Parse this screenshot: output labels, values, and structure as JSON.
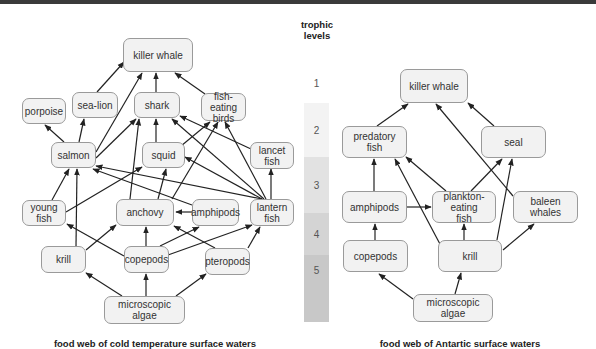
{
  "trophic": {
    "title": "trophic\nlevels",
    "levels": [
      {
        "label": "1",
        "color": "#ffffff"
      },
      {
        "label": "2",
        "color": "#f3f3f3"
      },
      {
        "label": "3",
        "color": "#e2e2e2"
      },
      {
        "label": "4",
        "color": "#d4d4d4"
      },
      {
        "label": "5",
        "color": "#c8c8c8"
      }
    ]
  },
  "left_web": {
    "caption": "food web of cold temperature surface waters",
    "nodes": {
      "killer_whale": "killer whale",
      "porpoise": "porpoise",
      "sea_lion": "sea-lion",
      "shark": "shark",
      "fish_eating_birds": "fish-eating\nbirds",
      "salmon": "salmon",
      "squid": "squid",
      "lancet_fish": "lancet\nfish",
      "young_fish": "young\nfish",
      "anchovy": "anchovy",
      "amphipods": "amphipods",
      "lantern_fish": "lantern\nfish",
      "krill": "krill",
      "copepods": "copepods",
      "pteropods": "pteropods",
      "microscopic_algae": "microscopic algae"
    },
    "edges": [
      [
        "sea_lion",
        "killer_whale"
      ],
      [
        "salmon",
        "killer_whale"
      ],
      [
        "shark",
        "killer_whale"
      ],
      [
        "fish_eating_birds",
        "killer_whale"
      ],
      [
        "salmon",
        "porpoise"
      ],
      [
        "salmon",
        "sea_lion"
      ],
      [
        "salmon",
        "shark"
      ],
      [
        "anchovy",
        "shark"
      ],
      [
        "squid",
        "shark"
      ],
      [
        "lancet_fish",
        "shark"
      ],
      [
        "lantern_fish",
        "shark"
      ],
      [
        "squid",
        "fish_eating_birds"
      ],
      [
        "anchovy",
        "fish_eating_birds"
      ],
      [
        "lantern_fish",
        "fish_eating_birds"
      ],
      [
        "lantern_fish",
        "squid"
      ],
      [
        "lantern_fish",
        "salmon"
      ],
      [
        "lantern_fish",
        "lancet_fish"
      ],
      [
        "amphipods",
        "salmon"
      ],
      [
        "amphipods",
        "anchovy"
      ],
      [
        "young_fish",
        "salmon"
      ],
      [
        "young_fish",
        "squid"
      ],
      [
        "anchovy",
        "squid"
      ],
      [
        "krill",
        "salmon"
      ],
      [
        "krill",
        "anchovy"
      ],
      [
        "copepods",
        "young_fish"
      ],
      [
        "copepods",
        "anchovy"
      ],
      [
        "copepods",
        "amphipods"
      ],
      [
        "copepods",
        "lantern_fish"
      ],
      [
        "pteropods",
        "lantern_fish"
      ],
      [
        "pteropods",
        "anchovy"
      ],
      [
        "microscopic_algae",
        "krill"
      ],
      [
        "microscopic_algae",
        "copepods"
      ],
      [
        "microscopic_algae",
        "pteropods"
      ]
    ]
  },
  "right_web": {
    "caption": "food web of Antartic surface waters",
    "nodes": {
      "killer_whale": "killer whale",
      "predatory_fish": "predatory\nfish",
      "seal": "seal",
      "amphipods": "amphipods",
      "plankton_eating_fish": "plankton-eating\nfish",
      "baleen_whales": "baleen\nwhales",
      "copepods": "copepods",
      "krill": "krill",
      "microscopic_algae": "microscopic algae"
    },
    "edges": [
      [
        "predatory_fish",
        "killer_whale"
      ],
      [
        "seal",
        "killer_whale"
      ],
      [
        "baleen_whales",
        "killer_whale"
      ],
      [
        "amphipods",
        "predatory_fish"
      ],
      [
        "plankton_eating_fish",
        "predatory_fish"
      ],
      [
        "krill",
        "predatory_fish"
      ],
      [
        "plankton_eating_fish",
        "seal"
      ],
      [
        "krill",
        "seal"
      ],
      [
        "amphipods",
        "plankton_eating_fish"
      ],
      [
        "krill",
        "plankton_eating_fish"
      ],
      [
        "krill",
        "baleen_whales"
      ],
      [
        "copepods",
        "amphipods"
      ],
      [
        "microscopic_algae",
        "copepods"
      ],
      [
        "microscopic_algae",
        "krill"
      ]
    ]
  }
}
